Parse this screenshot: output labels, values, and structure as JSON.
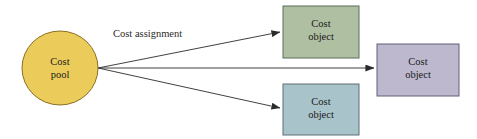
{
  "diagram": {
    "title": "Cost assignment",
    "nodes": [
      {
        "id": "cost-pool",
        "shape": "ellipse",
        "label_line1": "Cost",
        "label_line2": "pool",
        "fill": "#EBCC5B",
        "stroke": "#8a6f1f",
        "cx": 60,
        "cy": 68,
        "rx": 38,
        "ry": 37
      },
      {
        "id": "cost-object-green",
        "shape": "rect",
        "label_line1": "Cost",
        "label_line2": "object",
        "fill": "#AFBFA2",
        "stroke": "#5f6b58",
        "x": 283,
        "y": 6,
        "width": 76,
        "height": 52
      },
      {
        "id": "cost-object-blue",
        "shape": "rect",
        "label_line1": "Cost",
        "label_line2": "object",
        "fill": "#A9C3CB",
        "stroke": "#5c6e74",
        "x": 283,
        "y": 84,
        "width": 76,
        "height": 51
      },
      {
        "id": "cost-object-purple",
        "shape": "rect",
        "label_line1": "Cost",
        "label_line2": "object",
        "fill": "#BDB8CD",
        "stroke": "#61607a",
        "x": 377,
        "y": 44,
        "width": 82,
        "height": 52
      }
    ],
    "edges": [
      {
        "id": "edge-to-green",
        "from": "cost-pool",
        "to": "cost-object-green",
        "label": "Cost assignment",
        "x1": 98,
        "y1": 68,
        "x2": 280,
        "y2": 32
      },
      {
        "id": "edge-to-purple",
        "from": "cost-pool",
        "to": "cost-object-purple",
        "label": "",
        "x1": 98,
        "y1": 68,
        "x2": 374,
        "y2": 68
      },
      {
        "id": "edge-to-blue",
        "from": "cost-pool",
        "to": "cost-object-blue",
        "label": "",
        "x1": 98,
        "y1": 68,
        "x2": 280,
        "y2": 108
      }
    ],
    "edge_label": "Cost assignment",
    "line_color": "#2b2b2b",
    "background": "#ffffff"
  }
}
